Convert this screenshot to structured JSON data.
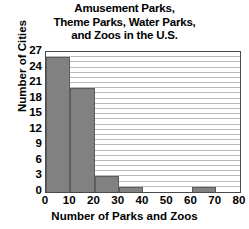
{
  "chart_data": {
    "type": "bar",
    "title": "Amusement Parks, Theme Parks, Water Parks, and Zoos in the U.S.",
    "title_lines": [
      "Amusement Parks,",
      "Theme Parks, Water Parks,",
      "and Zoos in the U.S."
    ],
    "xlabel": "Number of Parks and Zoos",
    "ylabel": "Number of Cities",
    "categories": [
      "0-10",
      "10-20",
      "20-30",
      "30-40",
      "40-50",
      "50-60",
      "60-70",
      "70-80"
    ],
    "bin_starts": [
      0,
      10,
      20,
      30,
      40,
      50,
      60,
      70
    ],
    "bin_width": 10,
    "values": [
      26,
      20,
      3,
      1,
      0,
      0,
      1,
      0
    ],
    "xlim": [
      0,
      80
    ],
    "ylim": [
      0,
      27
    ],
    "xticks": [
      "0",
      "10",
      "20",
      "30",
      "40",
      "50",
      "60",
      "70",
      "80"
    ],
    "xtick_values": [
      0,
      10,
      20,
      30,
      40,
      50,
      60,
      70,
      80
    ],
    "yticks": [
      "0",
      "3",
      "6",
      "9",
      "12",
      "15",
      "18",
      "21",
      "24",
      "27"
    ],
    "ytick_values": [
      0,
      3,
      6,
      9,
      12,
      15,
      18,
      21,
      24,
      27
    ],
    "grid": "horizontal",
    "grid_step": 1,
    "legend": null,
    "bar_color": "#818181",
    "bar_edge_color": "#5d5d5d",
    "grid_color": "#b9b9b9",
    "axis_color": "#4a4a4a",
    "text_color": "#000000"
  }
}
